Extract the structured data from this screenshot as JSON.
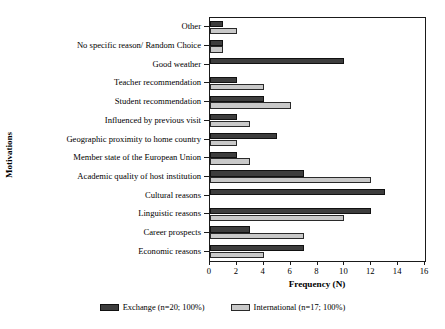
{
  "chart_data": {
    "type": "bar",
    "orientation": "horizontal",
    "title": "",
    "xlabel": "Frequency (N)",
    "ylabel": "Motivations",
    "xlim": [
      0,
      16
    ],
    "xticks": [
      0,
      2,
      4,
      6,
      8,
      10,
      12,
      14,
      16
    ],
    "grid": false,
    "legend_position": "bottom-center",
    "categories": [
      "Other",
      "No specific reason/ Random Choice",
      "Good weather",
      "Teacher recommendation",
      "Student recommendation",
      "Influenced by previous visit",
      "Geographic proximity to home country",
      "Member state of the European Union",
      "Academic quality of host institution",
      "Cultural reasons",
      "Linguistic reasons",
      "Career prospects",
      "Economic reasons"
    ],
    "series": [
      {
        "name": "Exchange (n=20; 100%)",
        "color": "#3d3d3d",
        "values": [
          1,
          1,
          10,
          2,
          4,
          2,
          5,
          2,
          7,
          13,
          12,
          3,
          7
        ]
      },
      {
        "name": "International (n=17; 100%)",
        "color": "#c9c9c9",
        "values": [
          2,
          1,
          0,
          4,
          6,
          3,
          2,
          3,
          12,
          0,
          10,
          7,
          4
        ]
      }
    ]
  },
  "legend": {
    "items": [
      {
        "label": "Exchange (n=20; 100%)",
        "swatch": "exchange"
      },
      {
        "label": "International (n=17; 100%)",
        "swatch": "international"
      }
    ]
  }
}
